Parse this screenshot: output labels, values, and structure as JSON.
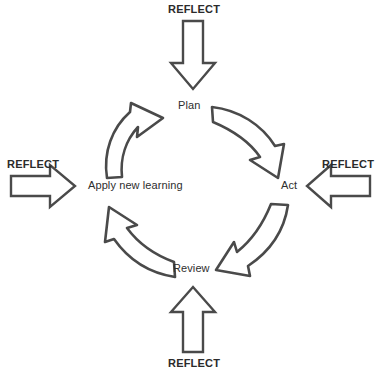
{
  "diagram": {
    "type": "cyclical-process-diagram",
    "stroke_color": "#4a4a4a",
    "fill_color": "#ffffff",
    "text_color": "#2e2e2e",
    "background_color": "#ffffff",
    "direction": "clockwise",
    "nodes": [
      {
        "id": "plan",
        "label": "Plan",
        "position": "top"
      },
      {
        "id": "act",
        "label": "Act",
        "position": "right"
      },
      {
        "id": "review",
        "label": "Review",
        "position": "bottom"
      },
      {
        "id": "apply",
        "label": "Apply new learning",
        "position": "left"
      }
    ],
    "cycle_arrows": [
      {
        "id": "apply-to-plan",
        "from": "Apply new learning",
        "to": "Plan",
        "style": "curved-outline"
      },
      {
        "id": "plan-to-act",
        "from": "Plan",
        "to": "Act",
        "style": "curved-outline"
      },
      {
        "id": "act-to-review",
        "from": "Act",
        "to": "Review",
        "style": "curved-outline"
      },
      {
        "id": "review-to-apply",
        "from": "Review",
        "to": "Apply new learning",
        "style": "curved-outline"
      }
    ],
    "reflect_arrows": [
      {
        "id": "reflect-top",
        "label": "REFLECT",
        "points_to": "Plan",
        "direction": "down"
      },
      {
        "id": "reflect-right",
        "label": "REFLECT",
        "points_to": "Act",
        "direction": "left"
      },
      {
        "id": "reflect-bottom",
        "label": "REFLECT",
        "points_to": "Review",
        "direction": "up"
      },
      {
        "id": "reflect-left",
        "label": "REFLECT",
        "points_to": "Apply new learning",
        "direction": "right"
      }
    ]
  }
}
